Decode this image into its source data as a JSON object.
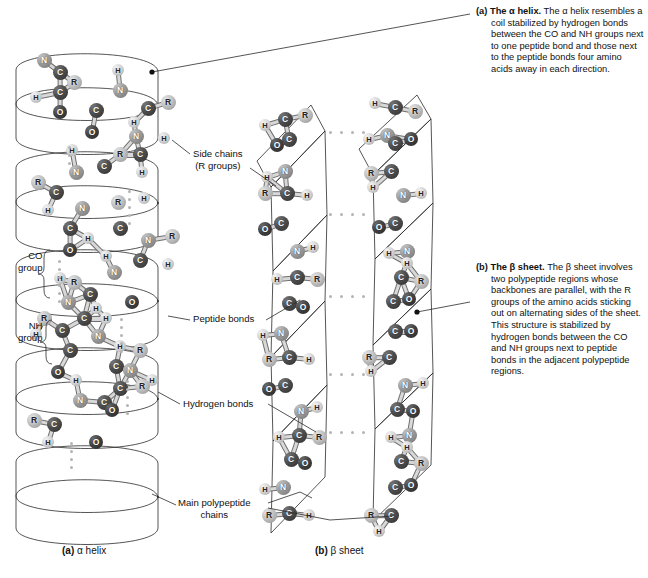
{
  "figure": {
    "panels": [
      "a",
      "b"
    ]
  },
  "captions": {
    "a": {
      "marker": "(a)",
      "lead": "The α helix.",
      "body": " The α helix resembles a coil stabilized by hydrogen bonds between the CO and NH groups next to one peptide bond and those next to the peptide bonds four amino acids away in each direction."
    },
    "b": {
      "marker": "(b)",
      "lead": "The β sheet.",
      "body": " The β sheet involves two polypeptide regions whose backbones are parallel, with the R groups of the amino acids sticking out on alternating sides of the sheet. This structure is stabilized by hydrogen bonds between the CO and NH groups next to peptide bonds in the adjacent polypeptide regions."
    }
  },
  "subcaptions": {
    "a": {
      "marker": "(a)",
      "text": " α helix"
    },
    "b": {
      "marker": "(b)",
      "text": " β sheet"
    }
  },
  "labels": {
    "side_chains_line1": "Side chains",
    "side_chains_line2": "(R groups)",
    "co_group_line1": "CO",
    "co_group_line2": "group",
    "nh_group_line1": "NH",
    "nh_group_line2": "group",
    "peptide_bonds": "Peptide bonds",
    "hydrogen_bonds": "Hydrogen bonds",
    "main_chains_line1": "Main polypeptide",
    "main_chains_line2": "chains"
  },
  "atoms": {
    "legend": [
      "N",
      "C",
      "O",
      "H",
      "R"
    ],
    "nitrogen": "N",
    "carbon": "C",
    "oxygen": "O",
    "hydrogen": "H",
    "r_group": "R"
  },
  "colors": {
    "ribbon_light": "#c9c9c9",
    "ribbon_mid": "#a6a6a6",
    "ribbon_dark": "#7f7f7f",
    "carbon": "#3d3d3d",
    "oxygen": "#333333",
    "nitrogen": "#9a9a9a",
    "hydrogen": "#d8d8d8",
    "rgroup": "#c0c0c0",
    "hbond_dot": "#b4b4b4",
    "text": "#111111",
    "leader": "#2a2a2a",
    "background": "#ffffff"
  },
  "helix_atoms": [
    {
      "t": "N",
      "x": 36,
      "y": 10
    },
    {
      "t": "C",
      "x": 52,
      "y": 22
    },
    {
      "t": "R",
      "x": 66,
      "y": 32
    },
    {
      "t": "H",
      "x": 28,
      "y": 47
    },
    {
      "t": "C",
      "x": 52,
      "y": 42
    },
    {
      "t": "O",
      "x": 52,
      "y": 62
    },
    {
      "t": "H",
      "x": 110,
      "y": 20
    },
    {
      "t": "N",
      "x": 112,
      "y": 40
    },
    {
      "t": "C",
      "x": 88,
      "y": 60
    },
    {
      "t": "O",
      "x": 84,
      "y": 82
    },
    {
      "t": "C",
      "x": 140,
      "y": 58
    },
    {
      "t": "R",
      "x": 160,
      "y": 52
    },
    {
      "t": "H",
      "x": 126,
      "y": 72
    },
    {
      "t": "N",
      "x": 128,
      "y": 86
    },
    {
      "t": "H",
      "x": 156,
      "y": 88
    },
    {
      "t": "R",
      "x": 112,
      "y": 104
    },
    {
      "t": "C",
      "x": 132,
      "y": 104
    },
    {
      "t": "H",
      "x": 134,
      "y": 122
    },
    {
      "t": "H",
      "x": 64,
      "y": 100
    },
    {
      "t": "N",
      "x": 68,
      "y": 122
    },
    {
      "t": "C",
      "x": 96,
      "y": 116
    },
    {
      "t": "R",
      "x": 30,
      "y": 132
    },
    {
      "t": "C",
      "x": 48,
      "y": 142
    },
    {
      "t": "H",
      "x": 40,
      "y": 160
    },
    {
      "t": "N",
      "x": 74,
      "y": 158
    },
    {
      "t": "C",
      "x": 62,
      "y": 178
    },
    {
      "t": "R",
      "x": 110,
      "y": 152
    },
    {
      "t": "H",
      "x": 136,
      "y": 148
    },
    {
      "t": "O",
      "x": 62,
      "y": 200
    },
    {
      "t": "C",
      "x": 112,
      "y": 178
    },
    {
      "t": "H",
      "x": 80,
      "y": 188
    },
    {
      "t": "N",
      "x": 140,
      "y": 190
    },
    {
      "t": "R",
      "x": 164,
      "y": 186
    },
    {
      "t": "C",
      "x": 132,
      "y": 210
    },
    {
      "t": "H",
      "x": 160,
      "y": 214
    },
    {
      "t": "N",
      "x": 106,
      "y": 222
    },
    {
      "t": "H",
      "x": 98,
      "y": 206
    },
    {
      "t": "R",
      "x": 66,
      "y": 232
    },
    {
      "t": "H",
      "x": 52,
      "y": 228
    },
    {
      "t": "C",
      "x": 82,
      "y": 244
    },
    {
      "t": "N",
      "x": 60,
      "y": 252
    },
    {
      "t": "H",
      "x": 88,
      "y": 258
    },
    {
      "t": "O",
      "x": 124,
      "y": 252
    },
    {
      "t": "C",
      "x": 76,
      "y": 268
    },
    {
      "t": "R",
      "x": 36,
      "y": 268
    },
    {
      "t": "H",
      "x": 28,
      "y": 284
    },
    {
      "t": "C",
      "x": 54,
      "y": 280
    },
    {
      "t": "N",
      "x": 90,
      "y": 286
    },
    {
      "t": "H",
      "x": 98,
      "y": 268
    },
    {
      "t": "C",
      "x": 62,
      "y": 300
    },
    {
      "t": "H",
      "x": 112,
      "y": 296
    },
    {
      "t": "R",
      "x": 132,
      "y": 300
    },
    {
      "t": "C",
      "x": 108,
      "y": 316
    },
    {
      "t": "N",
      "x": 122,
      "y": 320
    },
    {
      "t": "H",
      "x": 144,
      "y": 330
    },
    {
      "t": "O",
      "x": 50,
      "y": 322
    },
    {
      "t": "H",
      "x": 68,
      "y": 330
    },
    {
      "t": "C",
      "x": 112,
      "y": 338
    },
    {
      "t": "R",
      "x": 134,
      "y": 336
    },
    {
      "t": "N",
      "x": 72,
      "y": 350
    },
    {
      "t": "C",
      "x": 96,
      "y": 352
    },
    {
      "t": "O",
      "x": 104,
      "y": 360
    },
    {
      "t": "R",
      "x": 26,
      "y": 370
    },
    {
      "t": "C",
      "x": 46,
      "y": 374
    },
    {
      "t": "H",
      "x": 40,
      "y": 392
    },
    {
      "t": "O",
      "x": 88,
      "y": 392
    }
  ],
  "sheet_strands": [
    {
      "name": "strand-left",
      "atoms": [
        {
          "t": "H",
          "x": 10,
          "y": 30
        },
        {
          "t": "C",
          "x": 30,
          "y": 24
        },
        {
          "t": "R",
          "x": 50,
          "y": 20
        },
        {
          "t": "C",
          "x": 34,
          "y": 44
        },
        {
          "t": "O",
          "x": 22,
          "y": 50
        },
        {
          "t": "N",
          "x": 30,
          "y": 76
        },
        {
          "t": "H",
          "x": 12,
          "y": 82
        },
        {
          "t": "C",
          "x": 32,
          "y": 98
        },
        {
          "t": "R",
          "x": 10,
          "y": 98
        },
        {
          "t": "H",
          "x": 52,
          "y": 100
        },
        {
          "t": "C",
          "x": 26,
          "y": 128
        },
        {
          "t": "O",
          "x": 10,
          "y": 134
        },
        {
          "t": "N",
          "x": 42,
          "y": 156
        },
        {
          "t": "H",
          "x": 58,
          "y": 152
        },
        {
          "t": "C",
          "x": 42,
          "y": 182
        },
        {
          "t": "H",
          "x": 22,
          "y": 184
        },
        {
          "t": "R",
          "x": 62,
          "y": 184
        },
        {
          "t": "C",
          "x": 34,
          "y": 208
        },
        {
          "t": "O",
          "x": 48,
          "y": 212
        },
        {
          "t": "N",
          "x": 26,
          "y": 238
        },
        {
          "t": "H",
          "x": 8,
          "y": 240
        },
        {
          "t": "C",
          "x": 34,
          "y": 262
        },
        {
          "t": "R",
          "x": 14,
          "y": 264
        },
        {
          "t": "H",
          "x": 54,
          "y": 264
        },
        {
          "t": "C",
          "x": 30,
          "y": 290
        },
        {
          "t": "O",
          "x": 14,
          "y": 294
        },
        {
          "t": "N",
          "x": 46,
          "y": 316
        },
        {
          "t": "H",
          "x": 62,
          "y": 312
        },
        {
          "t": "C",
          "x": 44,
          "y": 340
        },
        {
          "t": "H",
          "x": 24,
          "y": 342
        },
        {
          "t": "R",
          "x": 64,
          "y": 342
        },
        {
          "t": "C",
          "x": 36,
          "y": 364
        },
        {
          "t": "O",
          "x": 50,
          "y": 368
        },
        {
          "t": "N",
          "x": 28,
          "y": 392
        },
        {
          "t": "H",
          "x": 10,
          "y": 394
        },
        {
          "t": "C",
          "x": 34,
          "y": 418
        },
        {
          "t": "R",
          "x": 14,
          "y": 420
        },
        {
          "t": "H",
          "x": 54,
          "y": 420
        }
      ]
    },
    {
      "name": "strand-right",
      "atoms": [
        {
          "t": "H",
          "x": 120,
          "y": 8
        },
        {
          "t": "C",
          "x": 140,
          "y": 12
        },
        {
          "t": "R",
          "x": 160,
          "y": 16
        },
        {
          "t": "N",
          "x": 132,
          "y": 40
        },
        {
          "t": "H",
          "x": 114,
          "y": 44
        },
        {
          "t": "C",
          "x": 140,
          "y": 48
        },
        {
          "t": "O",
          "x": 156,
          "y": 44
        },
        {
          "t": "C",
          "x": 136,
          "y": 76
        },
        {
          "t": "R",
          "x": 116,
          "y": 78
        },
        {
          "t": "H",
          "x": 118,
          "y": 92
        },
        {
          "t": "N",
          "x": 148,
          "y": 100
        },
        {
          "t": "H",
          "x": 166,
          "y": 98
        },
        {
          "t": "C",
          "x": 140,
          "y": 128
        },
        {
          "t": "O",
          "x": 124,
          "y": 132
        },
        {
          "t": "N",
          "x": 152,
          "y": 156
        },
        {
          "t": "H",
          "x": 134,
          "y": 158
        },
        {
          "t": "C",
          "x": 146,
          "y": 182
        },
        {
          "t": "H",
          "x": 152,
          "y": 168
        },
        {
          "t": "R",
          "x": 166,
          "y": 186
        },
        {
          "t": "C",
          "x": 138,
          "y": 206
        },
        {
          "t": "O",
          "x": 154,
          "y": 204
        },
        {
          "t": "C",
          "x": 140,
          "y": 236
        },
        {
          "t": "O",
          "x": 156,
          "y": 236
        },
        {
          "t": "C",
          "x": 134,
          "y": 262
        },
        {
          "t": "R",
          "x": 114,
          "y": 262
        },
        {
          "t": "H",
          "x": 116,
          "y": 276
        },
        {
          "t": "N",
          "x": 150,
          "y": 290
        },
        {
          "t": "H",
          "x": 168,
          "y": 288
        },
        {
          "t": "C",
          "x": 142,
          "y": 314
        },
        {
          "t": "O",
          "x": 158,
          "y": 316
        },
        {
          "t": "N",
          "x": 154,
          "y": 340
        },
        {
          "t": "H",
          "x": 136,
          "y": 342
        },
        {
          "t": "C",
          "x": 146,
          "y": 366
        },
        {
          "t": "H",
          "x": 152,
          "y": 352
        },
        {
          "t": "R",
          "x": 166,
          "y": 368
        },
        {
          "t": "C",
          "x": 140,
          "y": 392
        },
        {
          "t": "O",
          "x": 156,
          "y": 390
        },
        {
          "t": "C",
          "x": 136,
          "y": 420
        },
        {
          "t": "R",
          "x": 116,
          "y": 420
        },
        {
          "t": "H",
          "x": 124,
          "y": 436
        }
      ]
    }
  ],
  "sheet_hbond_rows": [
    {
      "y": 36,
      "x0": 74,
      "x1": 108
    },
    {
      "y": 118,
      "x0": 74,
      "x1": 108
    },
    {
      "y": 200,
      "x0": 74,
      "x1": 108
    },
    {
      "y": 278,
      "x0": 74,
      "x1": 108
    },
    {
      "y": 336,
      "x0": 74,
      "x1": 108
    }
  ],
  "helix_hbond_columns": [
    {
      "x": 60,
      "y0": 96,
      "y1": 118
    },
    {
      "x": 120,
      "y0": 140,
      "y1": 176
    },
    {
      "x": 50,
      "y0": 210,
      "y1": 250
    },
    {
      "x": 112,
      "y0": 268,
      "y1": 300
    },
    {
      "x": 118,
      "y0": 330,
      "y1": 362
    },
    {
      "x": 62,
      "y0": 392,
      "y1": 420
    }
  ]
}
